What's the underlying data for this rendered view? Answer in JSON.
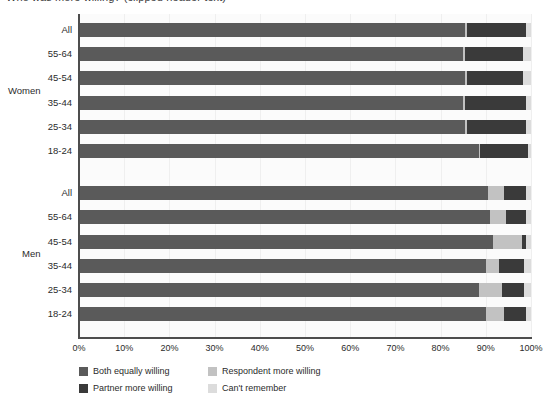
{
  "title": "Who was more willing? (clipped header text)",
  "chart_data": {
    "type": "bar",
    "orientation": "horizontal",
    "stacked": true,
    "title": "",
    "xlabel": "",
    "ylabel": "",
    "xlim": [
      0,
      100
    ],
    "xticks": [
      "0%",
      "10%",
      "20%",
      "30%",
      "40%",
      "50%",
      "60%",
      "70%",
      "80%",
      "90%",
      "100%"
    ],
    "grid": true,
    "legend_position": "bottom-left",
    "groups": [
      {
        "name": "Women",
        "categories": [
          "All",
          "55-64",
          "45-54",
          "35-44",
          "25-34",
          "18-24"
        ]
      },
      {
        "name": "Men",
        "categories": [
          "All",
          "55-64",
          "45-54",
          "35-44",
          "25-34",
          "18-24"
        ]
      }
    ],
    "series": [
      {
        "name": "Both equally willing",
        "color": "#5a5a5a",
        "values": [
          85.5,
          85.0,
          85.5,
          85.0,
          85.5,
          88.5,
          90.5,
          91.0,
          91.5,
          90.0,
          88.5,
          90.0
        ]
      },
      {
        "name": "Respondent more willing",
        "color": "#c2c2c2",
        "values": [
          0.3,
          0.3,
          0.3,
          0.3,
          0.3,
          0.3,
          3.5,
          3.5,
          6.5,
          3.0,
          5.0,
          4.0
        ]
      },
      {
        "name": "Partner more willing",
        "color": "#3a3a3a",
        "values": [
          13.0,
          13.0,
          12.5,
          13.5,
          13.0,
          10.5,
          5.0,
          4.5,
          0.8,
          5.5,
          5.0,
          5.0
        ]
      },
      {
        "name": "Can't remember",
        "color": "#dcdcdc",
        "values": [
          1.2,
          1.7,
          1.7,
          1.2,
          1.2,
          0.7,
          1.0,
          1.0,
          1.2,
          1.5,
          1.5,
          1.0
        ]
      }
    ],
    "rows": [
      {
        "group": "Women",
        "category": "All",
        "values": [
          85.5,
          0.3,
          13.0,
          1.2
        ]
      },
      {
        "group": "Women",
        "category": "55-64",
        "values": [
          85.0,
          0.3,
          13.0,
          1.7
        ]
      },
      {
        "group": "Women",
        "category": "45-54",
        "values": [
          85.5,
          0.3,
          12.5,
          1.7
        ]
      },
      {
        "group": "Women",
        "category": "35-44",
        "values": [
          85.0,
          0.3,
          13.5,
          1.2
        ]
      },
      {
        "group": "Women",
        "category": "25-34",
        "values": [
          85.5,
          0.3,
          13.0,
          1.2
        ]
      },
      {
        "group": "Women",
        "category": "18-24",
        "values": [
          88.5,
          0.3,
          10.5,
          0.7
        ]
      },
      {
        "group": "Men",
        "category": "All",
        "values": [
          90.5,
          3.5,
          5.0,
          1.0
        ]
      },
      {
        "group": "Men",
        "category": "55-64",
        "values": [
          91.0,
          3.5,
          4.5,
          1.0
        ]
      },
      {
        "group": "Men",
        "category": "45-54",
        "values": [
          91.5,
          6.5,
          0.8,
          1.2
        ]
      },
      {
        "group": "Men",
        "category": "35-44",
        "values": [
          90.0,
          3.0,
          5.5,
          1.5
        ]
      },
      {
        "group": "Men",
        "category": "25-34",
        "values": [
          88.5,
          5.0,
          5.0,
          1.5
        ]
      },
      {
        "group": "Men",
        "category": "18-24",
        "values": [
          90.0,
          4.0,
          5.0,
          1.0
        ]
      }
    ]
  },
  "legend": {
    "items": [
      {
        "label": "Both equally willing",
        "color": "#5a5a5a",
        "col": 0,
        "row": 0
      },
      {
        "label": "Respondent more willing",
        "color": "#c2c2c2",
        "col": 1,
        "row": 0
      },
      {
        "label": "Partner more willing",
        "color": "#3a3a3a",
        "col": 0,
        "row": 1
      },
      {
        "label": "Can't remember",
        "color": "#dcdcdc",
        "col": 1,
        "row": 1
      }
    ]
  },
  "colors": {
    "both_equally": "#5a5a5a",
    "respondent_more": "#c2c2c2",
    "partner_more": "#3a3a3a",
    "cant_remember": "#dcdcdc",
    "axis": "#4d4d4d",
    "plot_bg": "#fbfbfb",
    "gridline": "#efefef",
    "text": "#2b2b2b"
  }
}
